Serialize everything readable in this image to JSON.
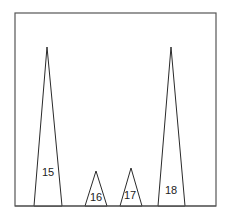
{
  "diagram": {
    "frame": {
      "x": 15,
      "y": 13,
      "width": 201,
      "height": 193,
      "stroke": "#555555"
    },
    "line_color": "#2a2a2a",
    "peaks": [
      {
        "label": "15",
        "apex": [
          47,
          47
        ],
        "base_left": 34,
        "base_right": 62,
        "label_pos": [
          48,
          176
        ]
      },
      {
        "label": "16",
        "apex": [
          96,
          171
        ],
        "base_left": 85,
        "base_right": 107,
        "label_pos": [
          96,
          201
        ]
      },
      {
        "label": "17",
        "apex": [
          131,
          168
        ],
        "base_left": 120,
        "base_right": 142,
        "label_pos": [
          130,
          199
        ]
      },
      {
        "label": "18",
        "apex": [
          171,
          47
        ],
        "base_left": 158,
        "base_right": 185,
        "label_pos": [
          171,
          194
        ]
      }
    ]
  }
}
